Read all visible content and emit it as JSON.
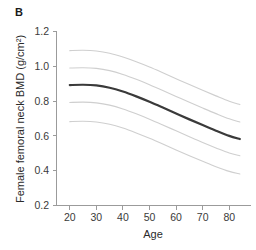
{
  "figure": {
    "panel_label": "B"
  },
  "chart_data": {
    "type": "line",
    "title": "",
    "subtitle": "",
    "xlabel": "Age",
    "ylabel": "Female femoral neck BMD (g/cm²)",
    "xlim": [
      15,
      88
    ],
    "ylim": [
      0.2,
      1.2
    ],
    "xticks": [
      20,
      30,
      40,
      50,
      60,
      70,
      80
    ],
    "xtick_labels": [
      "20",
      "30",
      "40",
      "50",
      "60",
      "70",
      "80"
    ],
    "yticks": [
      0.2,
      0.4,
      0.6,
      0.8,
      1.0,
      1.2
    ],
    "ytick_labels": [
      "0.2",
      "0.4",
      "0.6",
      "0.8",
      "1.0",
      "1.2"
    ],
    "grid": false,
    "legend": null,
    "x": [
      20,
      25,
      30,
      35,
      40,
      45,
      50,
      55,
      60,
      65,
      70,
      75,
      80,
      84
    ],
    "series": [
      {
        "name": "97th percentile",
        "color": "#cfcfcf",
        "width": 1.1,
        "values": [
          1.09,
          1.092,
          1.088,
          1.075,
          1.053,
          1.026,
          0.996,
          0.963,
          0.929,
          0.895,
          0.862,
          0.83,
          0.799,
          0.78
        ]
      },
      {
        "name": "75th percentile",
        "color": "#cfcfcf",
        "width": 1.1,
        "values": [
          0.99,
          0.992,
          0.988,
          0.975,
          0.953,
          0.925,
          0.894,
          0.861,
          0.827,
          0.793,
          0.76,
          0.728,
          0.698,
          0.68
        ]
      },
      {
        "name": "Mean",
        "color": "#3a3a3a",
        "width": 2.2,
        "values": [
          0.892,
          0.894,
          0.89,
          0.877,
          0.855,
          0.827,
          0.796,
          0.763,
          0.729,
          0.695,
          0.662,
          0.63,
          0.6,
          0.582
        ]
      },
      {
        "name": "25th percentile",
        "color": "#cfcfcf",
        "width": 1.1,
        "values": [
          0.792,
          0.794,
          0.79,
          0.777,
          0.755,
          0.727,
          0.696,
          0.663,
          0.629,
          0.595,
          0.562,
          0.531,
          0.502,
          0.486
        ]
      },
      {
        "name": "3rd percentile",
        "color": "#cfcfcf",
        "width": 1.1,
        "values": [
          0.682,
          0.684,
          0.68,
          0.667,
          0.645,
          0.617,
          0.586,
          0.553,
          0.519,
          0.486,
          0.454,
          0.423,
          0.396,
          0.381
        ]
      }
    ],
    "colors": {
      "median_line": "#3a3a3a",
      "band_line": "#cfcfcf",
      "axis": "#9b9b9b",
      "text": "#2b2b2b",
      "background": "#ffffff"
    }
  }
}
